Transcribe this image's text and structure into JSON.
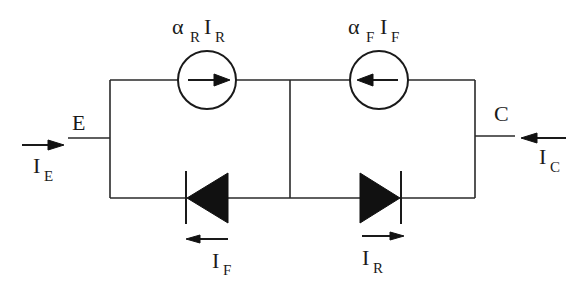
{
  "diagram": {
    "terminals": {
      "emitter": {
        "label": "E",
        "current": "I",
        "current_sub": "E"
      },
      "collector": {
        "label": "C",
        "current": "I",
        "current_sub": "C"
      }
    },
    "sources": [
      {
        "alpha": "α",
        "alpha_sub": "R",
        "current": "I",
        "current_sub": "R",
        "direction": "right"
      },
      {
        "alpha": "α",
        "alpha_sub": "F",
        "current": "I",
        "current_sub": "F",
        "direction": "left"
      }
    ],
    "diodes": [
      {
        "current": "I",
        "current_sub": "F",
        "direction": "left"
      },
      {
        "current": "I",
        "current_sub": "R",
        "direction": "right"
      }
    ],
    "colors": {
      "line": "#2a2a2a",
      "fill": "#111111",
      "background": "#ffffff"
    }
  }
}
